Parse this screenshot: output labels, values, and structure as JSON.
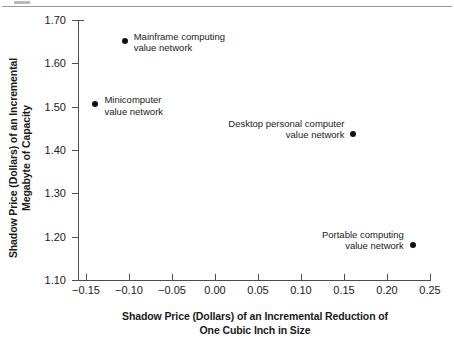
{
  "figure": {
    "divider_present": true
  },
  "chart_data": {
    "type": "scatter",
    "title": "",
    "xlabel": "Shadow Price (Dollars) of an Incremental Reduction of\nOne Cubic Inch in Size",
    "xlabel_line1": "Shadow Price (Dollars) of an Incremental Reduction of",
    "xlabel_line2": "One Cubic Inch in Size",
    "ylabel": "Shadow Price (Dollars) of an Incremental\nMegabyte of Capacity",
    "ylabel_line1": "Shadow Price (Dollars) of an Incremental",
    "ylabel_line2": "Megabyte of Capacity",
    "xlim": [
      -0.15,
      0.25
    ],
    "ylim": [
      1.1,
      1.7
    ],
    "xticks": [
      -0.15,
      -0.1,
      -0.05,
      0.0,
      0.05,
      0.1,
      0.15,
      0.2,
      0.25
    ],
    "yticks": [
      1.1,
      1.2,
      1.3,
      1.4,
      1.5,
      1.6,
      1.7
    ],
    "xtick_labels": [
      "−0.15",
      "−0.10",
      "−0.05",
      "0.00",
      "0.05",
      "0.10",
      "0.15",
      "0.20",
      "0.25"
    ],
    "ytick_labels": [
      "1.10",
      "1.20",
      "1.30",
      "1.40",
      "1.50",
      "1.60",
      "1.70"
    ],
    "grid": false,
    "legend": "none",
    "marker_color": "#111111",
    "axis_color": "#4d4d4d",
    "points": [
      {
        "label": "Mainframe computing\nvalue network",
        "label_line1": "Mainframe computing",
        "label_line2": "value network",
        "x": -0.105,
        "y": 1.652,
        "label_side": "right"
      },
      {
        "label": "Minicomputer\nvalue network",
        "label_line1": "Minicomputer",
        "label_line2": "value network",
        "x": -0.139,
        "y": 1.506,
        "label_side": "right"
      },
      {
        "label": "Desktop personal computer\nvalue network",
        "label_line1": "Desktop personal computer",
        "label_line2": "value network",
        "x": 0.161,
        "y": 1.437,
        "label_side": "left"
      },
      {
        "label": "Portable computing\nvalue network",
        "label_line1": "Portable computing",
        "label_line2": "value network",
        "x": 0.23,
        "y": 1.181,
        "label_side": "left"
      }
    ]
  }
}
